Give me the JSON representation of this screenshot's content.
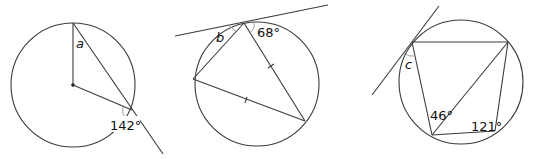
{
  "figures": [
    {
      "id": "figure-a",
      "unknown_label": "a",
      "angle_label": "142°",
      "description": "Circle with centre marked; radius to top, radius to lower-right point, chord from top extended beyond circle"
    },
    {
      "id": "figure-b",
      "unknown_label": "b",
      "angle_label": "68°",
      "description": "Circle with tangent at top; inscribed triangle with two equal sides marked by ticks"
    },
    {
      "id": "figure-c",
      "unknown_label": "c",
      "angle_labels": [
        "46°",
        "121°"
      ],
      "description": "Circle with tangent at upper-left; cyclic quadrilateral with a diagonal"
    }
  ],
  "colors": {
    "line": "#3a3a3a",
    "arc": "#8a8a8a",
    "background": "#ffffff"
  }
}
